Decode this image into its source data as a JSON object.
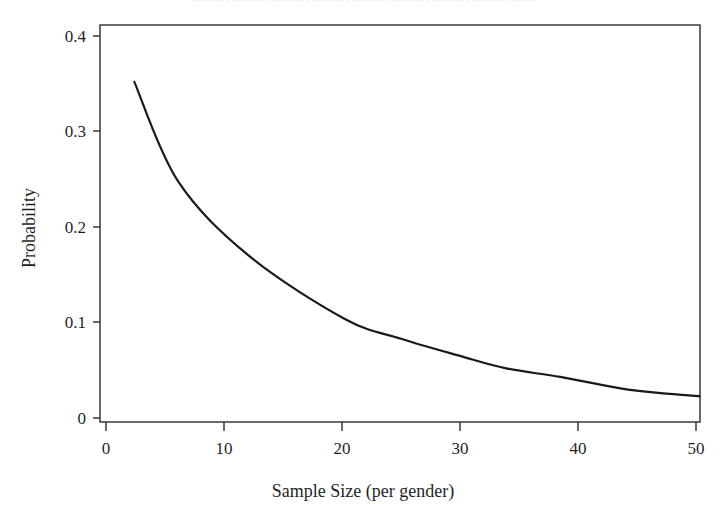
{
  "figure": {
    "background_color": "#ffffff",
    "clipped_caption_hint": "……………………………………………………………",
    "line_color": "#1a1a1a",
    "axis_color": "#2b2b2b"
  },
  "chart_data": {
    "type": "line",
    "title": "",
    "xlabel": "Sample Size (per gender)",
    "ylabel": "Probability",
    "xlim": [
      0,
      51
    ],
    "ylim": [
      0,
      0.42
    ],
    "xticks": [
      0,
      10,
      20,
      30,
      40,
      50
    ],
    "xtick_labels": [
      "0",
      "10",
      "20",
      "30",
      "40",
      "50"
    ],
    "yticks": [
      0,
      0.1,
      0.2,
      0.3,
      0.4
    ],
    "ytick_labels": [
      "0",
      "0.1",
      "0.2",
      "0.3",
      "0.4"
    ],
    "grid": false,
    "legend": null,
    "legend_position": "none",
    "series": [
      {
        "name": "Probability",
        "x": [
          2.4,
          6.1,
          12.1,
          20.2,
          25.0,
          30.0,
          33.9,
          38.5,
          43.6,
          47.0,
          50.3
        ],
        "values": [
          0.352,
          0.248,
          0.17,
          0.104,
          0.083,
          0.065,
          0.052,
          0.043,
          0.031,
          0.026,
          0.023
        ]
      }
    ]
  }
}
